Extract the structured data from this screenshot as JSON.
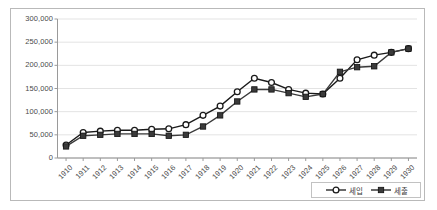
{
  "chart_data": {
    "type": "line",
    "title": "",
    "xlabel": "",
    "ylabel": "",
    "grid": true,
    "legend_position": "bottom-right",
    "ylim": [
      0,
      300000
    ],
    "ytick_labels": [
      "300,000",
      "250,000",
      "200,000",
      "150,000",
      "100,000",
      "50,000",
      "0"
    ],
    "ytick_values": [
      300000,
      250000,
      200000,
      150000,
      100000,
      50000,
      0
    ],
    "categories": [
      "1910",
      "1911",
      "1912",
      "1913",
      "1914",
      "1915",
      "1916",
      "1917",
      "1918",
      "1919",
      "1920",
      "1921",
      "1922",
      "1923",
      "1924",
      "1925",
      "1926",
      "1927",
      "1928",
      "1929",
      "1930"
    ],
    "series": [
      {
        "name": "세입",
        "marker": "open-circle",
        "color": "#1a1a1a",
        "values": [
          28000,
          55000,
          58000,
          60000,
          60000,
          62000,
          63000,
          72000,
          92000,
          112000,
          143000,
          172000,
          163000,
          148000,
          140000,
          138000,
          172000,
          212000,
          222000,
          228000,
          236000
        ]
      },
      {
        "name": "세출",
        "marker": "filled-square",
        "color": "#3a3a3a",
        "values": [
          25000,
          48000,
          50000,
          52000,
          52000,
          52000,
          48000,
          50000,
          68000,
          92000,
          122000,
          148000,
          148000,
          140000,
          132000,
          138000,
          186000,
          196000,
          198000,
          228000,
          236000
        ]
      }
    ]
  },
  "legend": {
    "items": [
      {
        "label": "세입",
        "marker": "open-circle"
      },
      {
        "label": "세출",
        "marker": "filled-square"
      }
    ]
  }
}
